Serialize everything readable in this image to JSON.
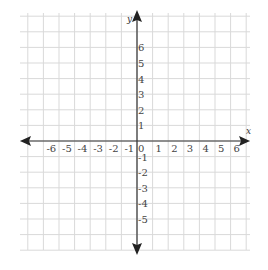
{
  "diagram": {
    "type": "coordinate-plane",
    "x_axis_label": "x",
    "y_axis_label": "y",
    "x_ticks": [
      "-6",
      "-5",
      "-4",
      "-3",
      "-2",
      "-1",
      "0",
      "1",
      "2",
      "3",
      "4",
      "5",
      "6"
    ],
    "y_ticks_positive": [
      "1",
      "2",
      "3",
      "4",
      "5",
      "6"
    ],
    "y_ticks_negative": [
      "-1",
      "-2",
      "-3",
      "-4",
      "-5"
    ],
    "x_range": [
      -7,
      7
    ],
    "y_range": [
      -7,
      8
    ],
    "grid": true,
    "colors": {
      "grid": "#d9d9d9",
      "axis": "#333333",
      "label": "#444444",
      "background": "#ffffff"
    }
  }
}
